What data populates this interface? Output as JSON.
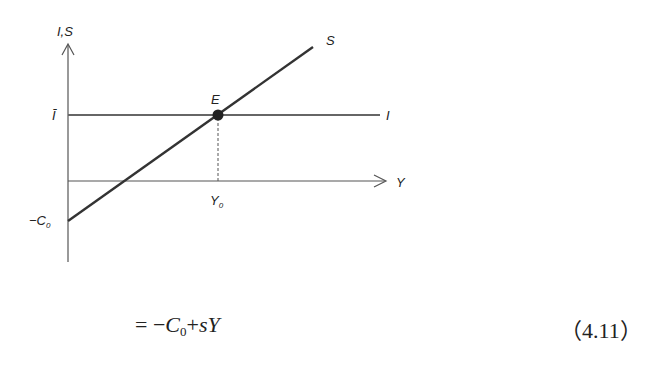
{
  "diagram": {
    "axes": {
      "y_label": "I,S",
      "x_label": "Y"
    },
    "lines": {
      "investment": {
        "label": "I",
        "level_label": "Ī"
      },
      "saving": {
        "label": "S",
        "intercept_label": "−C",
        "intercept_sub": "0"
      }
    },
    "equilibrium": {
      "label": "E",
      "x_label": "Y",
      "x_label_sub": "0"
    }
  },
  "equation": {
    "prefix": "= −",
    "c": "C",
    "c_sub": "0",
    "plus": "+",
    "s": "s",
    "y": "Y",
    "number": "（4.11）"
  },
  "colors": {
    "ink": "#222222",
    "i_line": "#555555"
  }
}
